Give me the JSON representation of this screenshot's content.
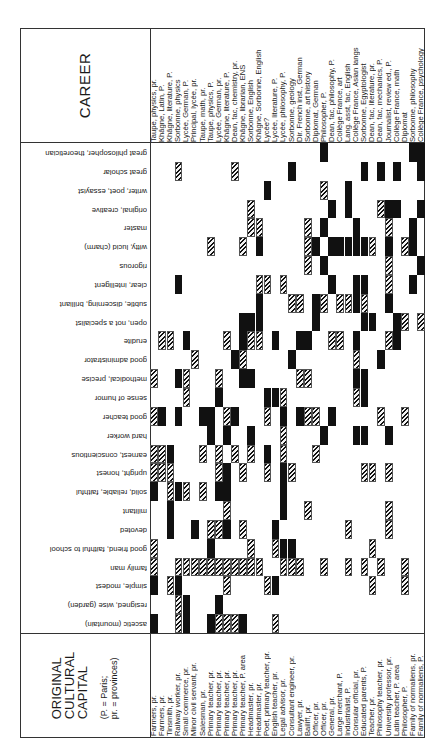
{
  "header": {
    "career_title": "CAREER",
    "origin_title_lines": [
      "ORIGINAL",
      "CULTURAL",
      "CAPITAL"
    ],
    "origin_note_lines": [
      "(P. = Paris;",
      "pr. = provinces)"
    ]
  },
  "careers": [
    "Taupe, physics, pr.",
    "Khâgne, Latin, P.",
    "Khâgne, literature, P.",
    "Sorbonne, physics",
    "Lycée, German, P.",
    "Principal, lycée, pr.",
    "Taupe, math, pr.",
    "Taupe, physics, P.",
    "Lycée, German, pr.",
    "Khâgne, literature, P.",
    "Dean, fac, chemistry, pr.",
    "Khâgne, librarian, ENS",
    "Sorbonne, English",
    "Khâgne, Sorbonne, English",
    "Lycée?",
    "Lycée, literature, P.",
    "Lycée, philosophy, P.",
    "Sorbonne, geology",
    "Dir. French inst., German",
    "Sorbonne, art history",
    "Diplomat, German",
    "Philosopher, P.",
    "Dean, fac, philosophy, P.",
    "Collège France, art",
    "Lang. asst, fac, English",
    "Collège France, Asian langs",
    "Sorbonne, Egyptologist",
    "Dean, fac, literature, pr.",
    "Dean, fac, mechanics, P.",
    "Journalist, review ed., P.",
    "Collège France, math",
    "Diplomat",
    "Sorbonne, philosophy",
    "Collège France, psychology"
  ],
  "origins": [
    "Farmers, pr.",
    "Farmers, pr.",
    "Tinsmith, pr.",
    "Railway worker, pr.",
    "Small commerce, pr.",
    "Minor civil servant, pr.",
    "Salesman, pr.",
    "Primary teacher, pr.",
    "Primary teacher, pr.",
    "Primary teacher, pr.",
    "Primary teacher, pr.",
    "Primary teacher, P. area",
    "Headmaster, pr.",
    "Headmaster, pr.",
    "Poet, primary teacher, pr.",
    "English teacher, pr.",
    "Legal advisor, pr.",
    "Consultant engineer, pr.",
    "Lawyer, pr.",
    "Bailiff, pr.",
    "Officer, pr.",
    "Officer, pr.",
    "General, pr.",
    "Large merchant, P.",
    "Industrialist, P.",
    "Consular official, pr.",
    "Educated parents, P.",
    "Teacher, pr.",
    "Philosophy teacher, pr.",
    "University professor, pr.",
    "Latin teacher, P. area",
    "Philosopher, P.",
    "Family of normaliens, pr.",
    "Family of normaliens, P."
  ],
  "traits": [
    "great philosopher, theoretician",
    "great scholar",
    "writer, poet, essayist",
    "original, creative",
    "master",
    "witty, lucid (charm)",
    "rigorous",
    "clear, intelligent",
    "subtle, discerning, brilliant",
    "open, not a specialist",
    "erudite",
    "good administrator",
    "methodical, precise",
    "sense of humor",
    "good teacher",
    "hard worker",
    "earnest, conscientious",
    "upright, honest",
    "solid, reliable, faithful",
    "militant",
    "devoted",
    "good friend, faithful to school",
    "family man",
    "simple, modest",
    "resigned, wise (garden)",
    "ascetic (mountain)"
  ],
  "legend": {
    "solid": "strong attribution",
    "hatch": "weaker attribution"
  },
  "cells": [
    [
      0,
      21,
      "s"
    ],
    [
      0,
      32,
      "s"
    ],
    [
      0,
      33,
      "s"
    ],
    [
      1,
      3,
      "h"
    ],
    [
      1,
      10,
      "h"
    ],
    [
      1,
      17,
      "s"
    ],
    [
      1,
      26,
      "s"
    ],
    [
      1,
      28,
      "s"
    ],
    [
      1,
      30,
      "s"
    ],
    [
      1,
      33,
      "s"
    ],
    [
      2,
      14,
      "s"
    ],
    [
      2,
      21,
      "h"
    ],
    [
      2,
      24,
      "s"
    ],
    [
      3,
      12,
      "h"
    ],
    [
      3,
      22,
      "s"
    ],
    [
      3,
      24,
      "s"
    ],
    [
      3,
      28,
      "h"
    ],
    [
      3,
      29,
      "s"
    ],
    [
      3,
      30,
      "s"
    ],
    [
      3,
      33,
      "s"
    ],
    [
      4,
      12,
      "h"
    ],
    [
      4,
      13,
      "h"
    ],
    [
      4,
      19,
      "h"
    ],
    [
      4,
      21,
      "s"
    ],
    [
      4,
      25,
      "s"
    ],
    [
      4,
      29,
      "h"
    ],
    [
      4,
      32,
      "s"
    ],
    [
      5,
      7,
      "h"
    ],
    [
      5,
      11,
      "h"
    ],
    [
      5,
      13,
      "s"
    ],
    [
      5,
      19,
      "h"
    ],
    [
      5,
      20,
      "s"
    ],
    [
      5,
      22,
      "s"
    ],
    [
      5,
      23,
      "s"
    ],
    [
      5,
      24,
      "s"
    ],
    [
      5,
      25,
      "s"
    ],
    [
      5,
      26,
      "s"
    ],
    [
      5,
      27,
      "h"
    ],
    [
      5,
      29,
      "s"
    ],
    [
      5,
      31,
      "h"
    ],
    [
      5,
      32,
      "s"
    ],
    [
      6,
      19,
      "h"
    ],
    [
      6,
      21,
      "s"
    ],
    [
      6,
      29,
      "h"
    ],
    [
      6,
      33,
      "s"
    ],
    [
      7,
      3,
      "s"
    ],
    [
      7,
      13,
      "h"
    ],
    [
      7,
      14,
      "h"
    ],
    [
      7,
      16,
      "h"
    ],
    [
      7,
      22,
      "s"
    ],
    [
      7,
      25,
      "s"
    ],
    [
      7,
      26,
      "s"
    ],
    [
      7,
      29,
      "h"
    ],
    [
      7,
      32,
      "s"
    ],
    [
      8,
      13,
      "s"
    ],
    [
      8,
      17,
      "h"
    ],
    [
      8,
      18,
      "h"
    ],
    [
      8,
      20,
      "s"
    ],
    [
      8,
      21,
      "h"
    ],
    [
      8,
      23,
      "h"
    ],
    [
      8,
      24,
      "h"
    ],
    [
      8,
      25,
      "s"
    ],
    [
      8,
      26,
      "h"
    ],
    [
      8,
      29,
      "s"
    ],
    [
      9,
      11,
      "s"
    ],
    [
      9,
      12,
      "s"
    ],
    [
      9,
      13,
      "s"
    ],
    [
      9,
      20,
      "s"
    ],
    [
      9,
      26,
      "s"
    ],
    [
      9,
      27,
      "s"
    ],
    [
      9,
      30,
      "s"
    ],
    [
      9,
      31,
      "h"
    ],
    [
      9,
      33,
      "h"
    ],
    [
      10,
      1,
      "h"
    ],
    [
      10,
      2,
      "h"
    ],
    [
      10,
      4,
      "s"
    ],
    [
      10,
      9,
      "h"
    ],
    [
      10,
      11,
      "s"
    ],
    [
      10,
      12,
      "h"
    ],
    [
      10,
      13,
      "h"
    ],
    [
      10,
      15,
      "s"
    ],
    [
      10,
      18,
      "s"
    ],
    [
      10,
      19,
      "s"
    ],
    [
      10,
      22,
      "h"
    ],
    [
      10,
      23,
      "h"
    ],
    [
      10,
      25,
      "s"
    ],
    [
      10,
      29,
      "h"
    ],
    [
      10,
      30,
      "s"
    ],
    [
      11,
      5,
      "h"
    ],
    [
      11,
      10,
      "s"
    ],
    [
      11,
      11,
      "h"
    ],
    [
      11,
      17,
      "s"
    ],
    [
      11,
      25,
      "h"
    ],
    [
      11,
      28,
      "s"
    ],
    [
      12,
      0,
      "h"
    ],
    [
      12,
      3,
      "s"
    ],
    [
      12,
      4,
      "h"
    ],
    [
      12,
      8,
      "h"
    ],
    [
      12,
      11,
      "s"
    ],
    [
      12,
      12,
      "s"
    ],
    [
      12,
      18,
      "h"
    ],
    [
      12,
      19,
      "h"
    ],
    [
      12,
      25,
      "s"
    ],
    [
      12,
      26,
      "s"
    ],
    [
      13,
      4,
      "h"
    ],
    [
      13,
      8,
      "s"
    ],
    [
      13,
      14,
      "s"
    ],
    [
      13,
      15,
      "s"
    ],
    [
      13,
      16,
      "h"
    ],
    [
      13,
      25,
      "h"
    ],
    [
      13,
      26,
      "s"
    ],
    [
      14,
      0,
      "h"
    ],
    [
      14,
      1,
      "s"
    ],
    [
      14,
      3,
      "s"
    ],
    [
      14,
      6,
      "s"
    ],
    [
      14,
      7,
      "s"
    ],
    [
      14,
      9,
      "h"
    ],
    [
      14,
      10,
      "s"
    ],
    [
      14,
      14,
      "h"
    ],
    [
      14,
      16,
      "s"
    ],
    [
      14,
      18,
      "s"
    ],
    [
      14,
      19,
      "h"
    ],
    [
      14,
      20,
      "h"
    ],
    [
      14,
      22,
      "s"
    ],
    [
      14,
      28,
      "h"
    ],
    [
      14,
      31,
      "h"
    ],
    [
      15,
      7,
      "s"
    ],
    [
      15,
      9,
      "s"
    ],
    [
      15,
      12,
      "s"
    ],
    [
      15,
      16,
      "h"
    ],
    [
      15,
      21,
      "s"
    ],
    [
      15,
      25,
      "s"
    ],
    [
      15,
      26,
      "s"
    ],
    [
      15,
      29,
      "s"
    ],
    [
      16,
      0,
      "h"
    ],
    [
      16,
      1,
      "h"
    ],
    [
      16,
      2,
      "s"
    ],
    [
      16,
      6,
      "h"
    ],
    [
      16,
      8,
      "h"
    ],
    [
      16,
      10,
      "h"
    ],
    [
      16,
      12,
      "h"
    ],
    [
      16,
      14,
      "s"
    ],
    [
      16,
      16,
      "h"
    ],
    [
      16,
      20,
      "h"
    ],
    [
      17,
      0,
      "h"
    ],
    [
      17,
      1,
      "h"
    ],
    [
      17,
      2,
      "h"
    ],
    [
      17,
      8,
      "h"
    ],
    [
      17,
      9,
      "s"
    ],
    [
      17,
      11,
      "h"
    ],
    [
      17,
      14,
      "h"
    ],
    [
      17,
      16,
      "s"
    ],
    [
      17,
      17,
      "h"
    ],
    [
      17,
      26,
      "h"
    ],
    [
      17,
      27,
      "h"
    ],
    [
      17,
      29,
      "h"
    ],
    [
      18,
      0,
      "s"
    ],
    [
      18,
      2,
      "h"
    ],
    [
      18,
      3,
      "s"
    ],
    [
      18,
      4,
      "h"
    ],
    [
      18,
      6,
      "h"
    ],
    [
      18,
      8,
      "s"
    ],
    [
      18,
      9,
      "s"
    ],
    [
      18,
      16,
      "s"
    ],
    [
      19,
      2,
      "s"
    ],
    [
      19,
      9,
      "h"
    ],
    [
      19,
      16,
      "s"
    ],
    [
      19,
      19,
      "h"
    ],
    [
      19,
      29,
      "h"
    ],
    [
      20,
      2,
      "s"
    ],
    [
      20,
      5,
      "s"
    ],
    [
      20,
      7,
      "h"
    ],
    [
      20,
      8,
      "h"
    ],
    [
      20,
      9,
      "s"
    ],
    [
      20,
      11,
      "h"
    ],
    [
      20,
      15,
      "s"
    ],
    [
      20,
      24,
      "h"
    ],
    [
      20,
      29,
      "h"
    ],
    [
      21,
      0,
      "h"
    ],
    [
      21,
      7,
      "s"
    ],
    [
      21,
      12,
      "h"
    ],
    [
      21,
      15,
      "h"
    ],
    [
      21,
      16,
      "s"
    ],
    [
      21,
      17,
      "s"
    ],
    [
      21,
      27,
      "h"
    ],
    [
      22,
      0,
      "h"
    ],
    [
      22,
      3,
      "h"
    ],
    [
      22,
      4,
      "h"
    ],
    [
      22,
      5,
      "h"
    ],
    [
      22,
      6,
      "h"
    ],
    [
      22,
      7,
      "h"
    ],
    [
      22,
      8,
      "h"
    ],
    [
      22,
      9,
      "h"
    ],
    [
      22,
      10,
      "h"
    ],
    [
      22,
      11,
      "h"
    ],
    [
      22,
      12,
      "h"
    ],
    [
      22,
      13,
      "h"
    ],
    [
      22,
      16,
      "h"
    ],
    [
      22,
      17,
      "h"
    ],
    [
      22,
      18,
      "h"
    ],
    [
      22,
      21,
      "h"
    ],
    [
      22,
      24,
      "h"
    ],
    [
      22,
      26,
      "h"
    ],
    [
      22,
      28,
      "h"
    ],
    [
      22,
      31,
      "h"
    ],
    [
      22,
      26,
      "h"
    ],
    [
      23,
      0,
      "s"
    ],
    [
      23,
      2,
      "h"
    ],
    [
      23,
      3,
      "s"
    ],
    [
      23,
      9,
      "h"
    ],
    [
      23,
      14,
      "h"
    ],
    [
      23,
      15,
      "s"
    ],
    [
      23,
      31,
      "h"
    ],
    [
      23,
      27,
      "h"
    ],
    [
      24,
      3,
      "h"
    ],
    [
      24,
      4,
      "s"
    ],
    [
      24,
      8,
      "s"
    ],
    [
      25,
      0,
      "s"
    ],
    [
      25,
      3,
      "h"
    ],
    [
      25,
      4,
      "s"
    ],
    [
      25,
      7,
      "s"
    ],
    [
      25,
      8,
      "h"
    ],
    [
      25,
      9,
      "h"
    ],
    [
      25,
      10,
      "h"
    ],
    [
      25,
      11,
      "s"
    ],
    [
      25,
      15,
      "h"
    ]
  ]
}
